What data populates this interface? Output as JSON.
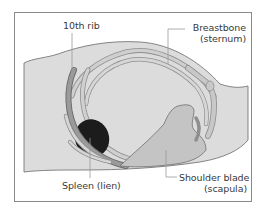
{
  "figure": {
    "type": "anatomical-illustration",
    "labels": {
      "rib": {
        "line1": "10th rib"
      },
      "sternum": {
        "line1": "Breastbone",
        "line2": "(sternum)"
      },
      "spleen": {
        "line1": "Spleen (lien)"
      },
      "scapula": {
        "line1": "Shoulder blade",
        "line2": "(scapula)"
      }
    },
    "colors": {
      "body": "#dcdcdc",
      "rib_fill": "#c8c8c8",
      "rib_outline": "#8e8e8e",
      "highlighted_rib": "#8f8f8f",
      "spleen": "#1c1c1c",
      "scapula": "#c4c4c4",
      "frame": "#8a8a8a",
      "leader_line": "#9a9a9a",
      "text": "#3a3a3a"
    }
  }
}
